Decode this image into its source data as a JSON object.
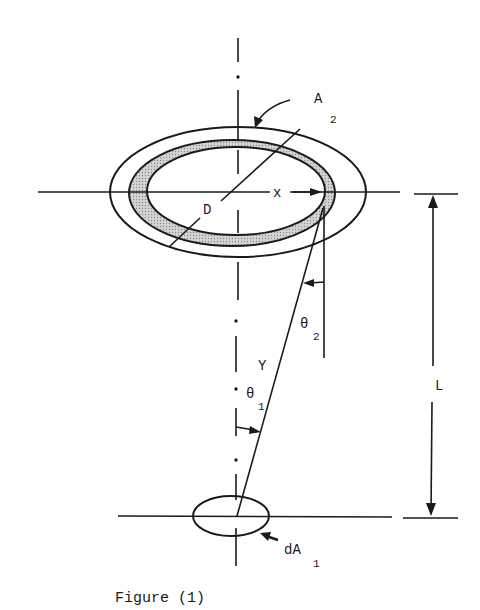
{
  "figure": {
    "caption": "Figure (1)",
    "labels": {
      "A": "A",
      "A_sub": "2",
      "D": "D",
      "x": "x",
      "theta2": "θ",
      "theta2_sub": "2",
      "y": "Y",
      "theta1": "θ",
      "theta1_sub": "1",
      "L": "L",
      "dA": "dA",
      "dA_sub": "1"
    },
    "elements": [
      "outer ellipse (disk A2)",
      "shaded annular ring of width dx at radius x",
      "inner ellipse",
      "diameter D leader line",
      "vertical centerline (dash-dot)",
      "horizontal plane line through A2",
      "line of sight y from dA1 to ring",
      "angle theta1 at dA1",
      "angle theta2 at ring",
      "dimension arrow L between planes",
      "small ellipse dA1",
      "horizontal plane line through dA1"
    ],
    "colors": {
      "ink": "#1a1a1a",
      "shade": "#bdbdbd",
      "background": "#ffffff"
    }
  }
}
